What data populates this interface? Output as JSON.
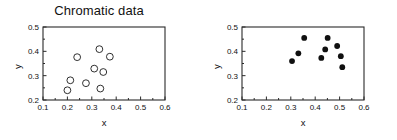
{
  "figure": {
    "background_color": "#ffffff",
    "axis_color": "#2a2a2a",
    "marker_color": "#101010"
  },
  "chart_data": [
    {
      "type": "scatter",
      "title": "Chromatic data",
      "xlabel": "x",
      "ylabel": "y",
      "xlim": [
        0.1,
        0.6
      ],
      "ylim": [
        0.2,
        0.5
      ],
      "xticks": [
        "0.1",
        "0.2",
        "0.3",
        "0.4",
        "0.5",
        "0.6"
      ],
      "yticks": [
        "0.2",
        "0.3",
        "0.4",
        "0.5"
      ],
      "xtick_values": [
        0.1,
        0.2,
        0.3,
        0.4,
        0.5,
        0.6
      ],
      "ytick_values": [
        0.2,
        0.3,
        0.4,
        0.5
      ],
      "grid": false,
      "legend": "none",
      "marker_style": "open-circle",
      "marker_size": 3.4,
      "points": [
        {
          "x": 0.2,
          "y": 0.24
        },
        {
          "x": 0.212,
          "y": 0.281
        },
        {
          "x": 0.24,
          "y": 0.376
        },
        {
          "x": 0.276,
          "y": 0.269
        },
        {
          "x": 0.31,
          "y": 0.329
        },
        {
          "x": 0.331,
          "y": 0.409
        },
        {
          "x": 0.335,
          "y": 0.247
        },
        {
          "x": 0.347,
          "y": 0.315
        },
        {
          "x": 0.374,
          "y": 0.378
        }
      ]
    },
    {
      "type": "scatter",
      "title": "",
      "xlabel": "x",
      "ylabel": "y",
      "xlim": [
        0.1,
        0.6
      ],
      "ylim": [
        0.2,
        0.5
      ],
      "xticks": [
        "0.1",
        "0.2",
        "0.3",
        "0.4",
        "0.5",
        "0.6"
      ],
      "yticks": [
        "0.2",
        "0.3",
        "0.4",
        "0.5"
      ],
      "xtick_values": [
        0.1,
        0.2,
        0.3,
        0.4,
        0.5,
        0.6
      ],
      "ytick_values": [
        0.2,
        0.3,
        0.4,
        0.5
      ],
      "grid": false,
      "legend": "none",
      "marker_style": "filled-circle",
      "marker_size": 2.9,
      "points": [
        {
          "x": 0.305,
          "y": 0.36
        },
        {
          "x": 0.331,
          "y": 0.392
        },
        {
          "x": 0.355,
          "y": 0.455
        },
        {
          "x": 0.425,
          "y": 0.373
        },
        {
          "x": 0.441,
          "y": 0.408
        },
        {
          "x": 0.451,
          "y": 0.455
        },
        {
          "x": 0.49,
          "y": 0.422
        },
        {
          "x": 0.505,
          "y": 0.38
        },
        {
          "x": 0.511,
          "y": 0.335
        }
      ]
    }
  ]
}
